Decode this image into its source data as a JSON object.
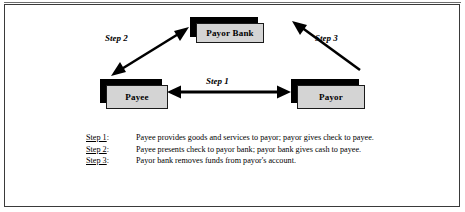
{
  "figure": {
    "background_color": "#ffffff",
    "frame_color": "#3a3a3a",
    "node_fill_color": "#d4d4d4",
    "node_border_color": "#1a1a1a",
    "node_shadow_color": "#000000",
    "arrow_color": "#000000"
  },
  "nodes": [
    {
      "id": "payor-bank",
      "label": "Payor Bank"
    },
    {
      "id": "payee",
      "label": "Payee"
    },
    {
      "id": "payor",
      "label": "Payor"
    }
  ],
  "arrows": [
    {
      "id": "step1",
      "label": "Step 1",
      "from": "Payee",
      "to": "Payor",
      "direction": "bidirectional",
      "orientation": "horizontal"
    },
    {
      "id": "step2",
      "label": "Step 2",
      "from": "Payee",
      "to": "Payor Bank",
      "direction": "bidirectional",
      "orientation": "diagonal-up-right"
    },
    {
      "id": "step3",
      "label": "Step 3",
      "from": "Payor",
      "to": "Payor Bank",
      "direction": "single",
      "orientation": "diagonal-up-left"
    }
  ],
  "legend": {
    "rows": [
      {
        "key_word": "Step 1",
        "key_suffix": ":",
        "text": "Payee provides goods and services to payor; payor gives check to payee."
      },
      {
        "key_word": "Step 2",
        "key_suffix": ":",
        "text": "Payee presents check to payor bank; payor bank gives cash to payee."
      },
      {
        "key_word": "Step 3",
        "key_suffix": ":",
        "text": "Payor bank removes funds from payor's account."
      }
    ]
  }
}
